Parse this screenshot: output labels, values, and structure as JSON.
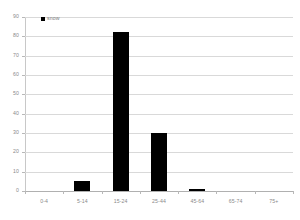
{
  "chart_data": {
    "type": "bar",
    "title": "",
    "xlabel": "",
    "ylabel": "",
    "categories": [
      "0-4",
      "5-14",
      "15-24",
      "25-44",
      "45-64",
      "65-74",
      "75+"
    ],
    "series": [
      {
        "name": "snow",
        "color": "#000000",
        "values": [
          0,
          5,
          82,
          30,
          1,
          0,
          0
        ]
      }
    ],
    "ylim": [
      0,
      90
    ],
    "yticks": [
      0,
      10,
      20,
      30,
      40,
      50,
      60,
      70,
      80,
      90
    ],
    "ytick_labels": [
      "0",
      "10",
      "20",
      "30",
      "40",
      "50",
      "60",
      "70",
      "80",
      "90"
    ],
    "grid": true,
    "grid_axis": "y",
    "legend": {
      "position": "top-left-inside",
      "entries": [
        {
          "label": "snow",
          "marker": "square",
          "color": "#000000"
        }
      ]
    },
    "background_color": "#ffffff",
    "gridline_color": "#d9d9d9",
    "tick_label_color": "#8a8a8a"
  }
}
